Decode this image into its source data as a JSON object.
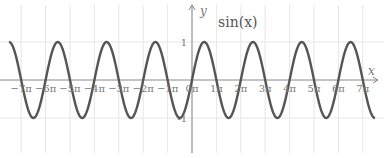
{
  "chart_data": {
    "type": "line",
    "title": "sin(x)",
    "xlabel": "x",
    "ylabel": "y",
    "xlim_pi": [
      -7.5,
      7.5
    ],
    "ylim": [
      -1.5,
      1.5
    ],
    "grid": true,
    "legend": "none",
    "x_tick_labels": [
      "−7π",
      "−6π",
      "−5π",
      "−4π",
      "−3π",
      "−2π",
      "−1π",
      "0π",
      "1π",
      "2π",
      "3π",
      "4π",
      "5π",
      "6π",
      "7π"
    ],
    "x_ticks_pi": [
      -7,
      -6,
      -5,
      -4,
      -3,
      -2,
      -1,
      0,
      1,
      2,
      3,
      4,
      5,
      6,
      7
    ],
    "y_tick_labels": [
      "1",
      "-1"
    ],
    "y_ticks": [
      1,
      -1
    ],
    "series": [
      {
        "name": "sin(x)",
        "function": "sin(x)",
        "color": "#555555"
      }
    ]
  }
}
